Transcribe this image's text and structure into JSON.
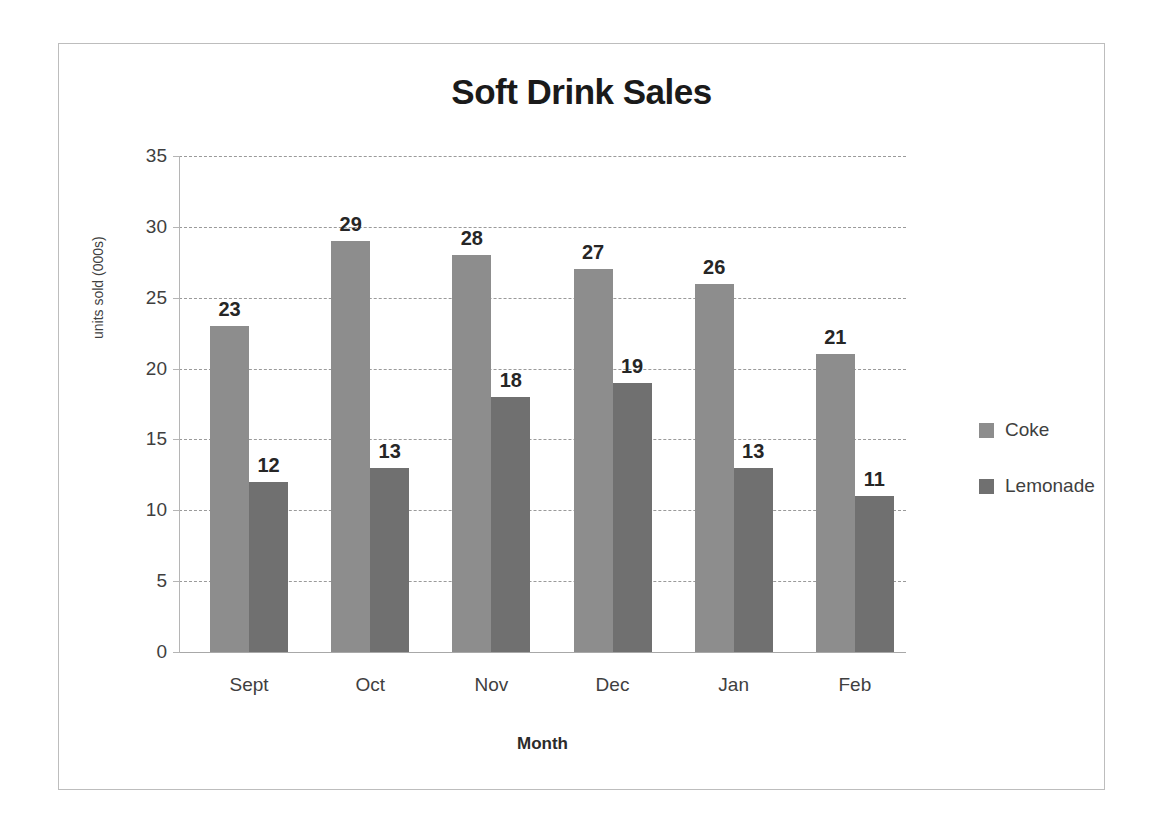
{
  "chart_data": {
    "type": "bar",
    "title": "Soft Drink Sales",
    "xlabel": "Month",
    "ylabel": "units sold (000s)",
    "categories": [
      "Sept",
      "Oct",
      "Nov",
      "Dec",
      "Jan",
      "Feb"
    ],
    "series": [
      {
        "name": "Coke",
        "color": "#8d8d8d",
        "values": [
          23,
          29,
          28,
          27,
          26,
          21
        ]
      },
      {
        "name": "Lemonade",
        "color": "#707070",
        "values": [
          12,
          13,
          18,
          19,
          13,
          11
        ]
      }
    ],
    "ylim": [
      0,
      35
    ],
    "ytick_labels": [
      "35",
      "30",
      "25",
      "20",
      "15",
      "10",
      "5",
      "0"
    ],
    "ytick_values": [
      35,
      30,
      25,
      20,
      15,
      10,
      5,
      0
    ],
    "grid": true,
    "grid_style": "dashed",
    "legend_position": "right",
    "data_labels": true,
    "frame_border_color": "#bdbdbd",
    "background": "#ffffff"
  }
}
